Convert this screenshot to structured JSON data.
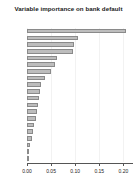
{
  "chart_data": {
    "type": "bar",
    "orientation": "horizontal",
    "title": "Variable importance on bank default",
    "xlabel": "",
    "ylabel": "",
    "xlim": [
      0.0,
      0.22
    ],
    "grid": true,
    "legend": null,
    "bar_color": "#bdbdbd",
    "bar_border_color": "#8a8a8a",
    "xticks": [
      0.0,
      0.05,
      0.1,
      0.15,
      0.2
    ],
    "xtick_labels": [
      "0.00",
      "0.05",
      "0.10",
      "0.15",
      "0.20"
    ],
    "categories": [
      "v27",
      "v39",
      "v06",
      "v40",
      "v43",
      "v34",
      "v16",
      "v41",
      "v28",
      "v17",
      "v60",
      "v36",
      "v31",
      "v10",
      "v47",
      "v23",
      "v11",
      "v44",
      "v8",
      "v13"
    ],
    "values": [
      0.205,
      0.105,
      0.098,
      0.095,
      0.062,
      0.058,
      0.05,
      0.038,
      0.03,
      0.027,
      0.024,
      0.022,
      0.02,
      0.018,
      0.015,
      0.012,
      0.01,
      0.007,
      0.004,
      0.002
    ]
  }
}
